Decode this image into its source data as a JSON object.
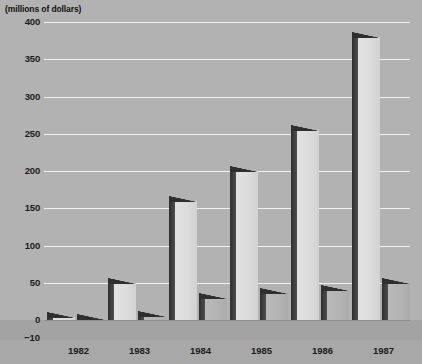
{
  "chart_data": {
    "type": "bar",
    "title": "(millions of dollars)",
    "xlabel": "",
    "ylabel": "",
    "ylim": [
      -10,
      400
    ],
    "grid": true,
    "legend": "none",
    "yticks": [
      400,
      350,
      300,
      250,
      200,
      150,
      100,
      50,
      0
    ],
    "negative_tick": "−10",
    "categories": [
      "1982",
      "1983",
      "1984",
      "1985",
      "1986",
      "1987"
    ],
    "series": [
      {
        "name": "primary",
        "values": [
          4,
          50,
          160,
          200,
          255,
          380
        ]
      },
      {
        "name": "secondary",
        "values": [
          0,
          6,
          30,
          36,
          40,
          50
        ]
      }
    ],
    "colors": {
      "background": "#b2b2b2",
      "gridline": "#f2f2f2",
      "bar_face_light": "#dcdcdc",
      "bar_face_dark": "#b3b3b3",
      "bar_side": "#3a3a3a",
      "text": "#1b1b1b",
      "floor": "#a3a3a3"
    }
  }
}
